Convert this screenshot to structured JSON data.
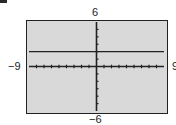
{
  "chart_data": {
    "type": "line",
    "title": "",
    "xlabel": "",
    "ylabel": "",
    "xlim": [
      -9,
      9
    ],
    "ylim": [
      -6,
      6
    ],
    "x_tick_step": 1,
    "y_tick_step": 1,
    "grid": false,
    "tick_labels": {
      "xmin": "−9",
      "xmax": "9",
      "ymin": "−6",
      "ymax": "6"
    },
    "series": [
      {
        "name": "y = 2",
        "equation": "y = 2",
        "x": [
          -9,
          9
        ],
        "y": [
          2,
          2
        ]
      }
    ]
  },
  "colors": {
    "screen": "#d9d9d9",
    "ink": "#222222"
  }
}
